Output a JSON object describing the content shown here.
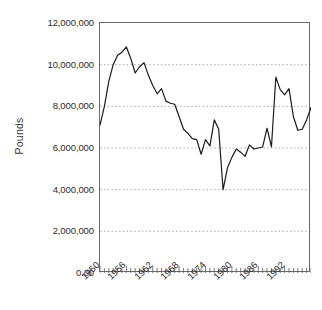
{
  "chart_data": {
    "type": "line",
    "title": "",
    "subtitle": "",
    "xlabel": "",
    "ylabel": "Pounds",
    "xlim": [
      1950,
      1998
    ],
    "ylim": [
      0,
      12000000
    ],
    "grid": "horizontal-dashed",
    "legend": "none",
    "y_ticks": [
      {
        "value": 12000000,
        "label": "12,000,000"
      },
      {
        "value": 10000000,
        "label": "10,000,000"
      },
      {
        "value": 8000000,
        "label": "8,000,000"
      },
      {
        "value": 6000000,
        "label": "6,000,000"
      },
      {
        "value": 4000000,
        "label": "4,000,000"
      },
      {
        "value": 2000000,
        "label": "2,000,000"
      },
      {
        "value": 0,
        "label": "0.00"
      }
    ],
    "x_ticks_major": [
      "1950",
      "1956",
      "1962",
      "1968",
      "1974",
      "1980",
      "1986",
      "1992"
    ],
    "x_ticks_major_values": [
      1950,
      1956,
      1962,
      1968,
      1974,
      1980,
      1986,
      1992
    ],
    "x_minor_tick_interval": 1,
    "line_color": "#1a1a1a",
    "line_width": 1.2,
    "x": [
      1950,
      1951,
      1952,
      1953,
      1954,
      1955,
      1956,
      1957,
      1958,
      1959,
      1960,
      1961,
      1962,
      1963,
      1964,
      1965,
      1966,
      1967,
      1968,
      1969,
      1970,
      1971,
      1972,
      1973,
      1974,
      1975,
      1976,
      1977,
      1978,
      1979,
      1980,
      1981,
      1982,
      1983,
      1984,
      1985,
      1986,
      1987,
      1988,
      1989,
      1990,
      1991,
      1992,
      1993,
      1994,
      1995,
      1996,
      1997,
      1998
    ],
    "values": [
      7100000,
      8000000,
      9200000,
      10000000,
      10450000,
      10600000,
      10850000,
      10300000,
      9600000,
      9900000,
      10100000,
      9500000,
      9000000,
      8600000,
      8850000,
      8250000,
      8150000,
      8100000,
      7500000,
      6900000,
      6700000,
      6450000,
      6400000,
      5700000,
      6400000,
      6100000,
      7350000,
      6900000,
      4000000,
      5050000,
      5550000,
      5950000,
      5800000,
      5600000,
      6150000,
      5950000,
      6000000,
      6050000,
      6950000,
      6050000,
      9400000,
      8800000,
      8550000,
      8850000,
      7500000,
      6850000,
      6900000,
      7350000,
      7950000
    ],
    "series": [
      {
        "name": "Pounds",
        "values": [
          7100000,
          8000000,
          9200000,
          10000000,
          10450000,
          10600000,
          10850000,
          10300000,
          9600000,
          9900000,
          10100000,
          9500000,
          9000000,
          8600000,
          8850000,
          8250000,
          8150000,
          8100000,
          7500000,
          6900000,
          6700000,
          6450000,
          6400000,
          5700000,
          6400000,
          6100000,
          7350000,
          6900000,
          4000000,
          5050000,
          5550000,
          5950000,
          5800000,
          5600000,
          6150000,
          5950000,
          6000000,
          6050000,
          6950000,
          6050000,
          9400000,
          8800000,
          8550000,
          8850000,
          7500000,
          6850000,
          6900000,
          7350000,
          7950000
        ]
      }
    ],
    "annotations": {
      "peak": {
        "x": 1956,
        "y": 10850000
      },
      "trough": {
        "x": 1978,
        "y": 4000000
      }
    }
  },
  "axes": {
    "y_title": "Pounds"
  }
}
